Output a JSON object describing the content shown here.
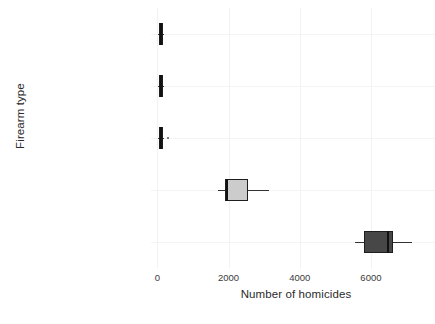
{
  "chart_data": {
    "type": "box",
    "title": "",
    "xlabel": "Number of homicides",
    "ylabel": "Firearm type",
    "xlim": [
      -180,
      7800
    ],
    "xticks": [
      0,
      2000,
      4000,
      6000
    ],
    "xticklabels": [
      "0",
      "2000",
      "4000",
      "6000"
    ],
    "grid": true,
    "legend": "none",
    "orientation": "horizontal",
    "categories": [
      "Other guns",
      "Shotguns",
      "Rifles",
      "Firearms, type not stated",
      "Handguns"
    ],
    "boxes": [
      {
        "category": "Other guns",
        "whisker_low": 30,
        "q1": 40,
        "median": 95,
        "q3": 150,
        "whisker_high": 160,
        "fill": "#2a2a2a",
        "outliers": []
      },
      {
        "category": "Shotguns",
        "whisker_low": 30,
        "q1": 40,
        "median": 95,
        "q3": 150,
        "whisker_high": 160,
        "fill": "#2a2a2a",
        "outliers": []
      },
      {
        "category": "Rifles",
        "whisker_low": 30,
        "q1": 45,
        "median": 100,
        "q3": 165,
        "whisker_high": 175,
        "fill": "#2a2a2a",
        "outliers": [
          310
        ]
      },
      {
        "category": "Firearms, type not stated",
        "whisker_low": 1690,
        "q1": 1900,
        "median": 1960,
        "q3": 2540,
        "whisker_high": 3130,
        "fill": "#cccccc",
        "outliers": []
      },
      {
        "category": "Handguns",
        "whisker_low": 5550,
        "q1": 5810,
        "median": 6480,
        "q3": 6620,
        "whisker_high": 7160,
        "fill": "#474747",
        "outliers": []
      }
    ]
  },
  "colors": {
    "axis_text": "#3a3a3a",
    "title_text": "#2b2b2b",
    "gridline": "#f2f2f2",
    "box_stroke": "#1e1e1e",
    "whisker": "#333333"
  }
}
